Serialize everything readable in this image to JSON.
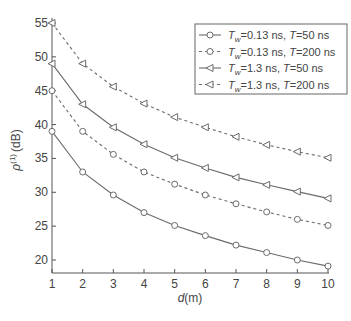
{
  "chart_data": {
    "type": "line",
    "title": "",
    "xlabel": "d (m)",
    "xlabel_italic": "d",
    "xlabel_unit": "(m)",
    "ylabel": "ρ(1) (dB)",
    "ylabel_symbol": "ρ",
    "ylabel_sup": "(1)",
    "ylabel_unit": "(dB)",
    "x": [
      1,
      2,
      3,
      4,
      5,
      6,
      7,
      8,
      9,
      10
    ],
    "xlim": [
      1,
      10
    ],
    "ylim": [
      18,
      55.5
    ],
    "xticks": [
      1,
      2,
      3,
      4,
      5,
      6,
      7,
      8,
      9,
      10
    ],
    "yticks": [
      20,
      25,
      30,
      35,
      40,
      45,
      50,
      55
    ],
    "grid": false,
    "legend_position": "upper right",
    "series": [
      {
        "name": "Tw=0.13 ns, T=50 ns",
        "tw": "0.13 ns",
        "t": "50 ns",
        "line": "solid",
        "marker": "circle",
        "values": [
          39,
          33,
          29.6,
          27,
          25.1,
          23.6,
          22.2,
          21.1,
          20,
          19.1
        ]
      },
      {
        "name": "Tw=0.13 ns, T=200 ns",
        "tw": "0.13 ns",
        "t": "200 ns",
        "line": "dashed",
        "marker": "circle",
        "values": [
          45,
          39,
          35.6,
          33,
          31.2,
          29.6,
          28.3,
          27.1,
          26,
          25.1
        ]
      },
      {
        "name": "Tw=1.3 ns, T=50 ns",
        "tw": "1.3 ns",
        "t": "50 ns",
        "line": "solid",
        "marker": "triangle-left",
        "values": [
          49,
          43,
          39.6,
          37.1,
          35.1,
          33.6,
          32.2,
          31.1,
          30.1,
          29.1
        ]
      },
      {
        "name": "Tw=1.3 ns, T=200 ns",
        "tw": "1.3 ns",
        "t": "200 ns",
        "line": "dashed",
        "marker": "triangle-left",
        "values": [
          55,
          49,
          45.6,
          43.1,
          41.1,
          39.6,
          38.2,
          37,
          36,
          35.1
        ]
      }
    ]
  },
  "legend": {
    "items": [
      {
        "prefix": "T",
        "sub": "w",
        "tw": "=0.13 ns, ",
        "t": "T",
        "tval": "=50 ns"
      },
      {
        "prefix": "T",
        "sub": "w",
        "tw": "=0.13 ns, ",
        "t": "T",
        "tval": "=200 ns"
      },
      {
        "prefix": "T",
        "sub": "w",
        "tw": "=1.3 ns, ",
        "t": "T",
        "tval": "=50 ns"
      },
      {
        "prefix": "T",
        "sub": "w",
        "tw": "=1.3 ns, ",
        "t": "T",
        "tval": "=200 ns"
      }
    ]
  },
  "colors": {
    "line": "#6b6b6b",
    "axis": "#555555",
    "text": "#444444",
    "legend_border": "#666666"
  }
}
